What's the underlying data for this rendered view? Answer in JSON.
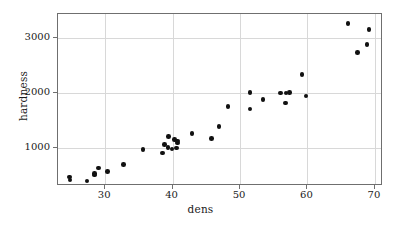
{
  "chart_data": {
    "type": "scatter",
    "title": "",
    "xlabel": "dens",
    "ylabel": "hardness",
    "xlim": [
      23.0,
      71.2
    ],
    "ylim": [
      320,
      3430
    ],
    "grid": true,
    "legend": null,
    "marker": "filled-circle",
    "marker_color": "#111111",
    "xticks": [
      30,
      40,
      50,
      60,
      70
    ],
    "xticklabels": [
      "30",
      "40",
      "50",
      "60",
      "70"
    ],
    "yticks": [
      1000,
      2000,
      3000
    ],
    "yticklabels": [
      "1000",
      "2000",
      "3000"
    ],
    "x": [
      24.7,
      24.8,
      27.3,
      28.4,
      28.4,
      29.0,
      30.3,
      32.7,
      35.6,
      38.5,
      38.8,
      39.3,
      39.4,
      39.9,
      40.3,
      40.6,
      40.7,
      40.7,
      42.9,
      45.8,
      46.9,
      48.2,
      51.5,
      51.5,
      53.4,
      56.0,
      56.7,
      56.8,
      57.3,
      59.2,
      59.8,
      66.0,
      67.4,
      68.8,
      69.1
    ],
    "y": [
      484,
      427,
      413,
      517,
      549,
      648,
      587,
      704,
      979,
      914,
      1070,
      1020,
      1210,
      989,
      1160,
      1010,
      1100,
      1130,
      1270,
      1180,
      1400,
      1760,
      2010,
      1712,
      1881,
      1998,
      1820,
      1999,
      2008,
      2337,
      1950,
      3260,
      2730,
      2880,
      3150
    ],
    "n_points": 35,
    "frame": {
      "left": 23.0,
      "right": 71.2,
      "bottom": 320,
      "top": 3430
    }
  },
  "axis": {
    "x_label": "dens",
    "y_label": "hardness"
  }
}
